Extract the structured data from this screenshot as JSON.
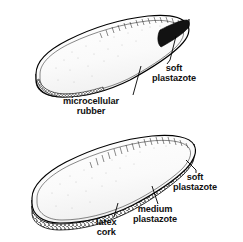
{
  "figure": {
    "style": "black-and-white line drawing",
    "background_color": "#ffffff",
    "line_color": "#000000",
    "fill_color": "#ffffff",
    "dark_layer_color": "#151515"
  },
  "diagrams": [
    {
      "id": "top-insole",
      "name": "Two-layer insole",
      "orientation": "three-quarter view, toe at left, heel at right",
      "labels": [
        {
          "id": "soft-plastazote-top",
          "lines": [
            "soft",
            "plastazote"
          ],
          "target": "upper cushioning layer at heel edge"
        },
        {
          "id": "microcellular-rubber",
          "lines": [
            "microcellular",
            "rubber"
          ],
          "target": "dark lower layer along sole edge"
        }
      ]
    },
    {
      "id": "bottom-insole",
      "name": "Three-layer insole",
      "orientation": "three-quarter view, toe at left, heel at right",
      "labels": [
        {
          "id": "soft-plastazote-bottom",
          "lines": [
            "soft",
            "plastazote"
          ],
          "target": "uppermost cushioning layer at heel edge"
        },
        {
          "id": "medium-plastazote",
          "lines": [
            "medium",
            "plastazote"
          ],
          "target": "middle layer along sole edge"
        },
        {
          "id": "latex-cork",
          "lines": [
            "latex",
            "cork"
          ],
          "target": "bottom speckled layer along sole edge"
        }
      ]
    }
  ]
}
